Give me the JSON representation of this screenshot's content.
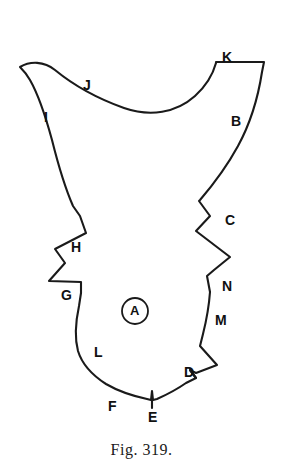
{
  "figure": {
    "caption": "Fig. 319.",
    "center_marker": {
      "text": "A",
      "shape": "circle",
      "cx": 135,
      "cy": 311,
      "r": 13
    },
    "stroke_color": "#1a1a1a",
    "background_color": "#ffffff",
    "labels": [
      {
        "id": "B",
        "text": "B",
        "x": 231,
        "y": 114,
        "anchor_x": 223,
        "anchor_y": 118
      },
      {
        "id": "C",
        "text": "C",
        "x": 225,
        "y": 213,
        "anchor_x": 216,
        "anchor_y": 214
      },
      {
        "id": "D",
        "text": "D",
        "x": 184,
        "y": 365,
        "anchor_x": 181,
        "anchor_y": 376
      },
      {
        "id": "E",
        "text": "E",
        "x": 148,
        "y": 410,
        "anchor_x": 152,
        "anchor_y": 401
      },
      {
        "id": "F",
        "text": "F",
        "x": 108,
        "y": 399,
        "anchor_x": 119,
        "anchor_y": 398
      },
      {
        "id": "G",
        "text": "G",
        "x": 61,
        "y": 288,
        "anchor_x": 72,
        "anchor_y": 283
      },
      {
        "id": "H",
        "text": "H",
        "x": 71,
        "y": 240,
        "anchor_x": 79,
        "anchor_y": 238
      },
      {
        "id": "I",
        "text": "I",
        "x": 44,
        "y": 110,
        "anchor_x": 52,
        "anchor_y": 118
      },
      {
        "id": "J",
        "text": "J",
        "x": 83,
        "y": 78,
        "anchor_x": 92,
        "anchor_y": 88
      },
      {
        "id": "K",
        "text": "K",
        "x": 222,
        "y": 50,
        "anchor_x": 224,
        "anchor_y": 62
      },
      {
        "id": "L",
        "text": "L",
        "x": 94,
        "y": 345,
        "anchor_x": 87,
        "anchor_y": 340
      },
      {
        "id": "M",
        "text": "M",
        "x": 215,
        "y": 313,
        "anchor_x": 208,
        "anchor_y": 312
      },
      {
        "id": "N",
        "text": "N",
        "x": 222,
        "y": 279,
        "anchor_x": 214,
        "anchor_y": 281
      }
    ],
    "outline": {
      "description": "closed irregular bone-like outline with notched margins",
      "path": "M 20 67 C 30 61, 44 61, 55 70 C 72 84, 96 98, 124 108 C 150 117, 176 113, 195 96 C 206 86, 213 74, 216 63 L 216 62 L 264 62 L 262 72 C 258 98, 250 124, 238 146 C 226 168, 212 186, 200 200 L 199 201 L 210 216 L 196 231 L 230 257 L 214 270 L 207 276 L 210 292 C 209 306, 206 322, 203 334 L 200 346 L 217 365 L 196 373 L 190 370 L 196 378 L 186 383 C 176 390, 166 395, 157 399 L 153 400 L 152 391 L 151 400 L 147 399 C 133 396, 118 391, 106 384 C 92 375, 82 364, 78 351 C 74 336, 76 320, 79 306 L 81 293 L 81 282 L 49 281 L 65 263 L 55 249 L 86 233 L 80 216 L 73 206 C 66 190, 58 164, 52 140 C 46 118, 38 94, 30 80 C 26 73, 22 69, 20 67 Z",
      "ticks": [
        "M 152 400 L 152 408",
        "M 190 370 L 196 378"
      ]
    }
  }
}
